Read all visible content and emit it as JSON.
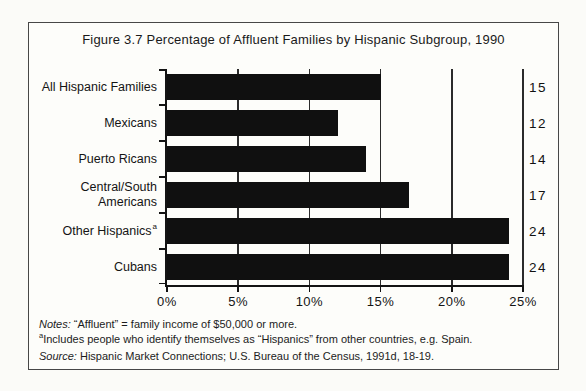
{
  "figure": {
    "title": "Figure 3.7 Percentage of Affluent Families by Hispanic Subgroup, 1990"
  },
  "chart_data": {
    "type": "bar",
    "orientation": "horizontal",
    "title": "Figure 3.7 Percentage of Affluent Families by Hispanic Subgroup, 1990",
    "categories": [
      "All Hispanic Families",
      "Mexicans",
      "Puerto Ricans",
      "Central/South Americans",
      "Other Hispanics",
      "Cubans"
    ],
    "category_label_lines": [
      [
        "All Hispanic Families"
      ],
      [
        "Mexicans"
      ],
      [
        "Puerto Ricans"
      ],
      [
        "Central/South",
        "Americans"
      ],
      [
        "Other Hispanics"
      ],
      [
        "Cubans"
      ]
    ],
    "category_superscripts": [
      "",
      "",
      "",
      "",
      "a",
      ""
    ],
    "values": [
      15,
      12,
      14,
      17,
      24,
      24
    ],
    "value_labels": [
      "15",
      "12",
      "14",
      "17",
      "24",
      "24"
    ],
    "unit": "%",
    "xlabel": "",
    "ylabel": "",
    "xlim": [
      0,
      25
    ],
    "x_ticks": [
      0,
      5,
      10,
      15,
      20,
      25
    ],
    "x_tick_labels": [
      "0%",
      "5%",
      "10%",
      "15%",
      "20%",
      "25%"
    ],
    "gridlines": "vertical-at-ticks",
    "legend": "none",
    "bar_color": "#101010",
    "background": "#fdfdfa"
  },
  "notes": {
    "note_label": "Notes:",
    "note_text": " “Affluent” = family income of $50,000 or more.",
    "footnote_marker": "a",
    "footnote_text": "Includes people who identify themselves as “Hispanics” from other countries, e.g. Spain.",
    "source_label": "Source:",
    "source_text": " Hispanic Market Connections; U.S. Bureau of the Census, 1991d, 18-19."
  }
}
